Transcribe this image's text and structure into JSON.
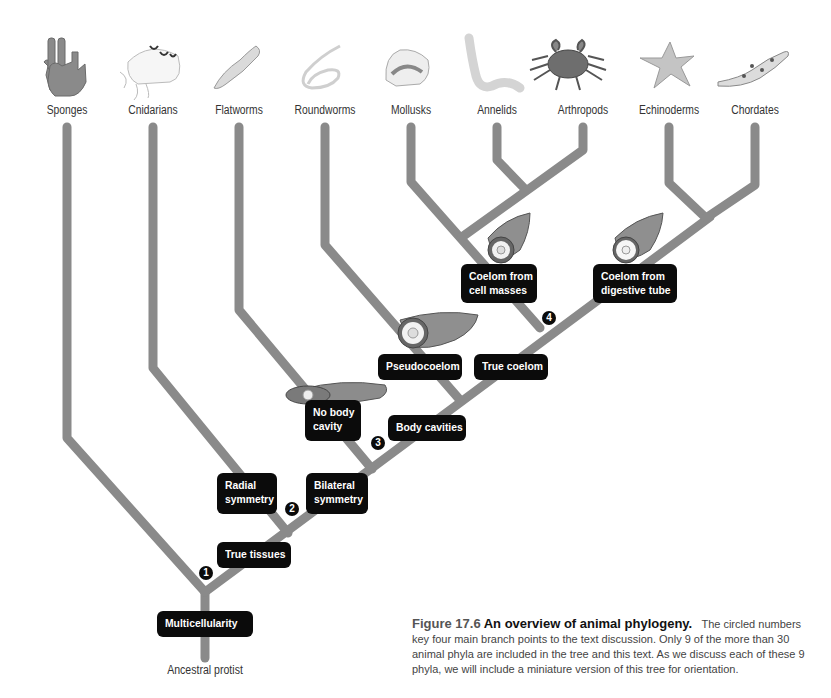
{
  "figure": {
    "number": "Figure 17.6",
    "title": "An overview of animal phylogeny.",
    "caption": "The circled numbers key four main branch points to the text discussion. Only 9 of the more than 30 animal phyla are included in the tree and this text. As we discuss each of these 9 phyla, we will include a miniature version of this tree for orientation."
  },
  "root": {
    "label": "Ancestral protist"
  },
  "phyla": [
    {
      "name": "Sponges",
      "icon": "sponge-icon"
    },
    {
      "name": "Cnidarians",
      "icon": "jellyfish-icon"
    },
    {
      "name": "Flatworms",
      "icon": "flatworm-icon"
    },
    {
      "name": "Roundworms",
      "icon": "roundworm-icon"
    },
    {
      "name": "Mollusks",
      "icon": "shell-icon"
    },
    {
      "name": "Annelids",
      "icon": "segmented-worm-icon"
    },
    {
      "name": "Arthropods",
      "icon": "crab-icon"
    },
    {
      "name": "Echinoderms",
      "icon": "starfish-icon"
    },
    {
      "name": "Chordates",
      "icon": "salamander-icon"
    }
  ],
  "traits": {
    "multicellularity": "Multicellularity",
    "true_tissues": "True tissues",
    "radial_symmetry": [
      "Radial",
      "symmetry"
    ],
    "bilateral_symmetry": [
      "Bilateral",
      "symmetry"
    ],
    "no_body_cavity": [
      "No body",
      "cavity"
    ],
    "body_cavities": "Body cavities",
    "pseudocoelom": "Pseudocoelom",
    "true_coelom": "True coelom",
    "coelom_cell_masses": [
      "Coelom from",
      "cell masses"
    ],
    "coelom_digestive_tube": [
      "Coelom from",
      "digestive tube"
    ]
  },
  "branch_points": [
    "1",
    "2",
    "3",
    "4"
  ],
  "colors": {
    "branch": "#8a8a8a",
    "label_box": "#0b0b0b",
    "label_text": "#ffffff",
    "background": "#ffffff"
  }
}
